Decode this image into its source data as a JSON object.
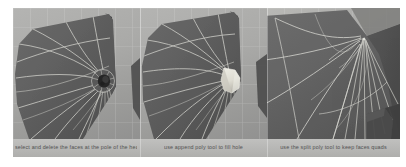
{
  "figure": {
    "background_color": "#9d9d9d",
    "panels": [
      {
        "id": "panel-1",
        "caption": "select and delete the faces at the pole of the head",
        "viewport_bg_color": "#aaaaa8",
        "mesh_color": "#5e5e5e",
        "wireframe_color": "#d8d8d2",
        "feature": "open hole at pole",
        "feature_color": "#2f2f2f"
      },
      {
        "id": "panel-2",
        "caption": "use append poly tool to fill hole",
        "viewport_bg_color": "#aaaaa8",
        "mesh_color": "#5e5e5e",
        "wireframe_color": "#d8d8d2",
        "feature": "hole filled with new polygon",
        "feature_color": "#e4e2d8"
      },
      {
        "id": "panel-3",
        "caption": "use the split poly tool to keep faces quads",
        "viewport_bg_color": "#a4a4a2",
        "mesh_color": "#636363",
        "wireframe_color": "#d8d8d2",
        "feature": "close-up of split poly edges radiating from pole",
        "feature_color": "#6e6e6e"
      }
    ],
    "caption_band_color": "#b9b9b7",
    "caption_text_color": "#4a4a4a"
  }
}
